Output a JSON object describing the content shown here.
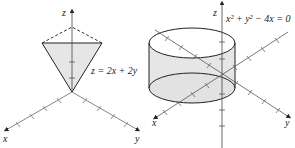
{
  "figures": [
    {
      "id": "plane-cone",
      "axes": {
        "x_label": "x",
        "y_label": "y",
        "z_label": "z"
      },
      "surface_label": "z = 2x + 2y",
      "colors": {
        "fill": "#e6e6e6",
        "stroke": "#222222",
        "axis": "#555555"
      }
    },
    {
      "id": "cylinder",
      "axes": {
        "x_label": "x",
        "y_label": "y",
        "z_label": "z"
      },
      "surface_label": "x² + y² − 4x = 0",
      "colors": {
        "fill": "#e6e6e6",
        "stroke": "#222222",
        "axis": "#555555"
      }
    }
  ]
}
